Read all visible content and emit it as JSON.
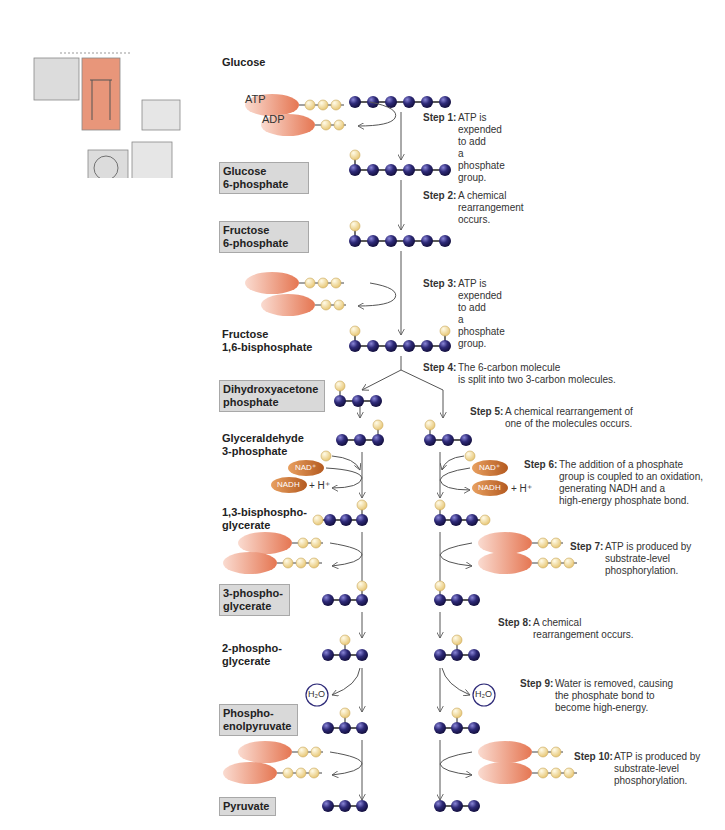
{
  "overview_thumbnail": {
    "description": "Cellular respiration overview with glycolysis highlighted",
    "highlight_color": "#e8967a"
  },
  "colors": {
    "carbon": "#2e2a78",
    "phosphate": "#f3dc9c",
    "adenosine": "#ee9a7e",
    "nad": "#d37a36",
    "label_box": "#d9d9d9",
    "arrow": "#555555"
  },
  "molecules": [
    {
      "label": "Glucose",
      "boxed": false
    },
    {
      "label": "Glucose\n6-phosphate",
      "boxed": true
    },
    {
      "label": "Fructose\n6-phosphate",
      "boxed": true
    },
    {
      "label": "Fructose\n1,6-bisphosphate",
      "boxed": false
    },
    {
      "label": "Dihydroxyacetone\nphosphate",
      "boxed": true
    },
    {
      "label": "Glyceraldehyde\n3-phosphate",
      "boxed": false
    },
    {
      "label": "1,3-bisphospho-\nglycerate",
      "boxed": false
    },
    {
      "label": "3-phospho-\nglycerate",
      "boxed": true
    },
    {
      "label": "2-phospho-\nglycerate",
      "boxed": false
    },
    {
      "label": "Phospho-\nenolpyruvate",
      "boxed": true
    },
    {
      "label": "Pyruvate",
      "boxed": true
    }
  ],
  "steps": [
    {
      "num": "Step 1:",
      "text": "ATP is expended to add\na phosphate group."
    },
    {
      "num": "Step 2:",
      "text": "A chemical\nrearrangement occurs."
    },
    {
      "num": "Step 3:",
      "text": "ATP is expended to add\na phosphate group."
    },
    {
      "num": "Step 4:",
      "text": "The 6-carbon molecule\nis split into two 3-carbon molecules."
    },
    {
      "num": "Step 5:",
      "text": "A chemical rearrangement of\none of the molecules occurs."
    },
    {
      "num": "Step 6:",
      "text": "The addition of a phosphate\ngroup is coupled to an oxidation,\ngenerating NADH and a\nhigh-energy phosphate bond."
    },
    {
      "num": "Step 7:",
      "text": "ATP is produced by\nsubstrate-level\nphosphorylation."
    },
    {
      "num": "Step 8:",
      "text": "A chemical\nrearrangement occurs."
    },
    {
      "num": "Step 9:",
      "text": "Water is removed, causing\nthe phosphate bond to\nbecome high-energy."
    },
    {
      "num": "Step 10:",
      "text": "ATP is produced by\nsubstrate-level\nphosphorylation."
    }
  ],
  "cofactors": {
    "atp": "ATP",
    "adp": "ADP",
    "nad_plus": "NAD⁺",
    "nadh": "NADH",
    "h_plus": "+ H⁺",
    "water": "H₂O"
  }
}
